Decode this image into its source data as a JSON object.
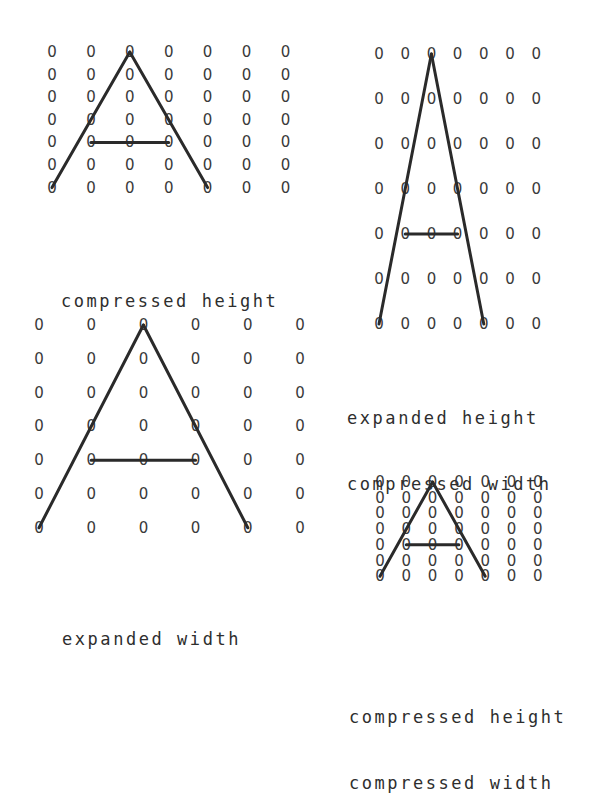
{
  "grid_symbol": "0",
  "letter": "A",
  "colors": {
    "ink": "#2a2a2a",
    "dots": "#3a3a3a",
    "background": "#ffffff"
  },
  "panels": [
    {
      "id": "compressed-height",
      "rows": 7,
      "cols": 7,
      "caption": [
        "compressed height"
      ],
      "strokes": [
        {
          "from": [
            0,
            2
          ],
          "to": [
            6,
            0
          ]
        },
        {
          "from": [
            0,
            2
          ],
          "to": [
            6,
            4
          ]
        },
        {
          "from": [
            4,
            1
          ],
          "to": [
            4,
            3
          ]
        }
      ]
    },
    {
      "id": "expanded-height-compressed-width",
      "rows": 7,
      "cols": 7,
      "caption": [
        "expanded height",
        "compressed width"
      ],
      "strokes": [
        {
          "from": [
            0,
            2
          ],
          "to": [
            6,
            0
          ]
        },
        {
          "from": [
            0,
            2
          ],
          "to": [
            6,
            4
          ]
        },
        {
          "from": [
            4,
            1
          ],
          "to": [
            4,
            3
          ]
        }
      ]
    },
    {
      "id": "expanded-width",
      "rows": 7,
      "cols": 6,
      "caption": [
        "expanded width"
      ],
      "strokes": [
        {
          "from": [
            0,
            2
          ],
          "to": [
            6,
            0
          ]
        },
        {
          "from": [
            0,
            2
          ],
          "to": [
            6,
            4
          ]
        },
        {
          "from": [
            4,
            1
          ],
          "to": [
            4,
            3
          ]
        }
      ]
    },
    {
      "id": "compressed-height-compressed-width",
      "rows": 7,
      "cols": 7,
      "caption": [
        "compressed height",
        "compressed width"
      ],
      "strokes": [
        {
          "from": [
            0,
            2
          ],
          "to": [
            6,
            0
          ]
        },
        {
          "from": [
            0,
            2
          ],
          "to": [
            6,
            4
          ]
        },
        {
          "from": [
            4,
            1
          ],
          "to": [
            4,
            3
          ]
        }
      ]
    }
  ]
}
